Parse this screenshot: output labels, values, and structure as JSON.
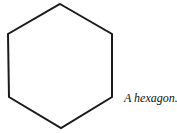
{
  "diagram": {
    "shape": "hexagon",
    "stroke_color": "#1a1a1a",
    "fill_color": "#ffffff",
    "points": "60,4 112,34 112,97 61,128 9,97 8,34",
    "caption": "A hexagon."
  }
}
